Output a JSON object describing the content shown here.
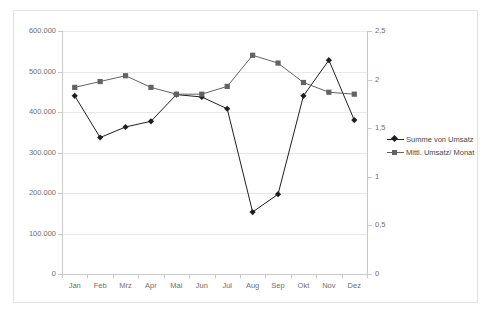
{
  "chart_data": {
    "type": "line",
    "title": "",
    "xlabel": "",
    "ylabel": "",
    "grid": true,
    "legend_position": "right",
    "categories": [
      "Jan",
      "Feb",
      "Mrz",
      "Apr",
      "Mai",
      "Jun",
      "Jul",
      "Aug",
      "Sep",
      "Okt",
      "Nov",
      "Dez"
    ],
    "axes": {
      "left": {
        "ylim": [
          0,
          600000
        ],
        "ticks": [
          0,
          100000,
          200000,
          300000,
          400000,
          500000,
          600000
        ],
        "tick_labels": [
          "0",
          "100.000",
          "200.000",
          "300.000",
          "400.000",
          "500.000",
          "600.000"
        ]
      },
      "right": {
        "ylim": [
          0,
          2.5
        ],
        "ticks": [
          0,
          0.5,
          1,
          1.5,
          2,
          2.5
        ],
        "tick_labels": [
          "0",
          "0,5",
          "1",
          "1,5",
          "2",
          "2,5"
        ]
      }
    },
    "series": [
      {
        "name": "Summe von Umsatz",
        "axis": "left",
        "marker": "diamond",
        "color": "#1f1f1f",
        "values": [
          440000,
          337000,
          363000,
          377000,
          443000,
          437000,
          408000,
          153000,
          197000,
          440000,
          528000,
          380000
        ]
      },
      {
        "name": "Mittl. Umsatz/ Monat",
        "axis": "right",
        "marker": "square",
        "color": "#636363",
        "values": [
          1.92,
          1.98,
          2.04,
          1.92,
          1.85,
          1.85,
          1.93,
          2.25,
          2.17,
          1.97,
          1.87,
          1.85
        ]
      }
    ]
  },
  "legend": {
    "items": [
      {
        "label": "Summe von Umsatz"
      },
      {
        "label": "Mittl. Umsatz/ Monat"
      }
    ]
  }
}
